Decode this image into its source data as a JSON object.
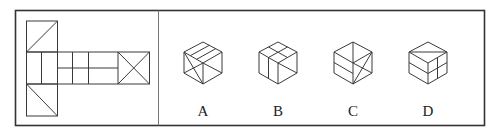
{
  "figure": {
    "type": "cube-net-puzzle",
    "frame": {
      "x": 15,
      "y": 10,
      "w": 469,
      "h": 115,
      "divider_x": 158,
      "stroke": "#333333"
    },
    "net": {
      "description": "T-shaped cube net: column of 3 squares on the left plus a row extending right",
      "cell": 31,
      "origin": {
        "x": 26,
        "y": 21
      }
    },
    "options": [
      {
        "label": "A",
        "cx": 203
      },
      {
        "label": "B",
        "cx": 278
      },
      {
        "label": "C",
        "cx": 353
      },
      {
        "label": "D",
        "cx": 428
      }
    ],
    "colors": {
      "line": "#3a3a3a",
      "text": "#222222",
      "background": "#ffffff"
    }
  }
}
